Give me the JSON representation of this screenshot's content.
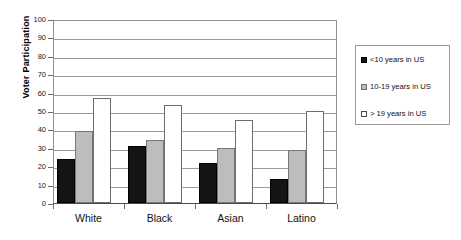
{
  "chart_data": {
    "type": "bar",
    "title": "",
    "xlabel": "",
    "ylabel": "Voter Participation",
    "ylim": [
      0,
      100
    ],
    "ytick_step": 10,
    "yticks": [
      100,
      90,
      80,
      70,
      60,
      50,
      40,
      30,
      20,
      10,
      0
    ],
    "grid": true,
    "legend_position": "right",
    "categories": [
      "White",
      "Black",
      "Asian",
      "Latino"
    ],
    "series": [
      {
        "name": "<10 years in US",
        "color": "#141414",
        "values": [
          24,
          31,
          22,
          13
        ]
      },
      {
        "name": "10-19 years in US",
        "color": "#bdbdbd",
        "values": [
          39,
          34,
          30,
          29
        ]
      },
      {
        "name": "> 19 years in US",
        "color": "#ffffff",
        "values": [
          57,
          53,
          45,
          50
        ]
      }
    ]
  },
  "legend": {
    "entries": [
      {
        "label": "<10 years in US",
        "swatch": "black-square-swatch"
      },
      {
        "label": "10-19 years in US",
        "swatch": "gray-square-swatch"
      },
      {
        "label": "> 19 years in US",
        "swatch": "white-square-swatch"
      }
    ]
  }
}
